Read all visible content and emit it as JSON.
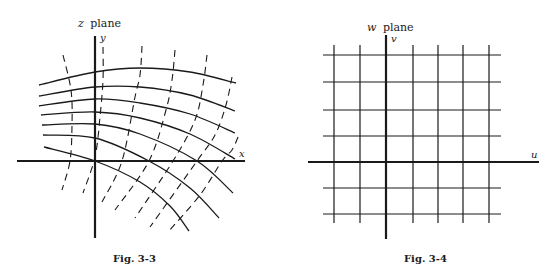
{
  "colors": {
    "ink": "#1a1a1a",
    "background": "#ffffff"
  },
  "figures": [
    {
      "id": "fig-3-3",
      "plane_label": {
        "var": "z",
        "word": "plane",
        "x": 78,
        "y": 27
      },
      "caption": {
        "text": "Fig. 3-3",
        "x": 113,
        "y": 262
      },
      "axes": {
        "vertical": {
          "label": "y",
          "x": 95,
          "y1": 36,
          "y2": 238,
          "label_x": 100,
          "label_y": 41
        },
        "horizontal": {
          "label": "x",
          "y": 161,
          "x1": 17,
          "x2": 245,
          "label_x": 239,
          "label_y": 157
        }
      },
      "solid_curves": [
        [
          [
            39,
            85
          ],
          [
            95,
            72
          ],
          [
            140,
            68
          ],
          [
            190,
            72
          ],
          [
            236,
            83
          ]
        ],
        [
          [
            39,
            96
          ],
          [
            95,
            87
          ],
          [
            140,
            87
          ],
          [
            190,
            95
          ],
          [
            235,
            111
          ]
        ],
        [
          [
            39,
            106
          ],
          [
            95,
            99
          ],
          [
            140,
            103
          ],
          [
            190,
            114
          ],
          [
            235,
            133
          ]
        ],
        [
          [
            41,
            115
          ],
          [
            95,
            112
          ],
          [
            140,
            118
          ],
          [
            190,
            134
          ],
          [
            235,
            159
          ]
        ],
        [
          [
            42,
            125
          ],
          [
            95,
            124
          ],
          [
            140,
            134
          ],
          [
            197,
            161
          ],
          [
            233,
            193
          ]
        ],
        [
          [
            43,
            135
          ],
          [
            95,
            138
          ],
          [
            149,
            161
          ],
          [
            190,
            188
          ],
          [
            219,
            218
          ]
        ],
        [
          [
            44,
            147
          ],
          [
            95,
            161
          ],
          [
            140,
            182
          ],
          [
            170,
            206
          ],
          [
            189,
            231
          ]
        ]
      ],
      "dashed_curves": [
        [
          [
            63,
            55
          ],
          [
            71,
            90
          ],
          [
            72,
            125
          ],
          [
            70,
            161
          ],
          [
            62,
            190
          ]
        ],
        [
          [
            103,
            47
          ],
          [
            103,
            80
          ],
          [
            100,
            117
          ],
          [
            95,
            157
          ],
          [
            83,
            193
          ]
        ],
        [
          [
            142,
            46
          ],
          [
            140,
            75
          ],
          [
            135,
            97
          ],
          [
            122,
            161
          ],
          [
            102,
            202
          ]
        ],
        [
          [
            175,
            50
          ],
          [
            172,
            80
          ],
          [
            166,
            110
          ],
          [
            149,
            161
          ],
          [
            115,
            210
          ]
        ],
        [
          [
            207,
            55
          ],
          [
            203,
            85
          ],
          [
            195,
            120
          ],
          [
            173,
            161
          ],
          [
            135,
            218
          ]
        ],
        [
          [
            232,
            77
          ],
          [
            226,
            105
          ],
          [
            215,
            135
          ],
          [
            197,
            161
          ],
          [
            150,
            227
          ]
        ],
        [
          [
            238,
            137
          ],
          [
            232,
            150
          ],
          [
            222,
            161
          ],
          [
            200,
            195
          ],
          [
            168,
            232
          ]
        ]
      ]
    },
    {
      "id": "fig-3-4",
      "plane_label": {
        "var": "w",
        "word": "plane",
        "x": 367,
        "y": 31
      },
      "caption": {
        "text": "Fig. 3-4",
        "x": 404,
        "y": 262
      },
      "axes": {
        "vertical": {
          "label": "v",
          "x": 386,
          "y1": 35,
          "y2": 239,
          "label_x": 391,
          "label_y": 42
        },
        "horizontal": {
          "label": "u",
          "y": 162,
          "x1": 308,
          "x2": 539,
          "label_x": 531,
          "label_y": 158
        }
      },
      "grid": {
        "vertical_lines_x": [
          334,
          360,
          413,
          438,
          463,
          489
        ],
        "vertical_y1": 45,
        "vertical_y2": 223,
        "horizontal_lines_y": [
          55,
          82,
          110,
          136,
          188,
          214
        ],
        "horizontal_x1": 323,
        "horizontal_x2": 501
      }
    }
  ]
}
